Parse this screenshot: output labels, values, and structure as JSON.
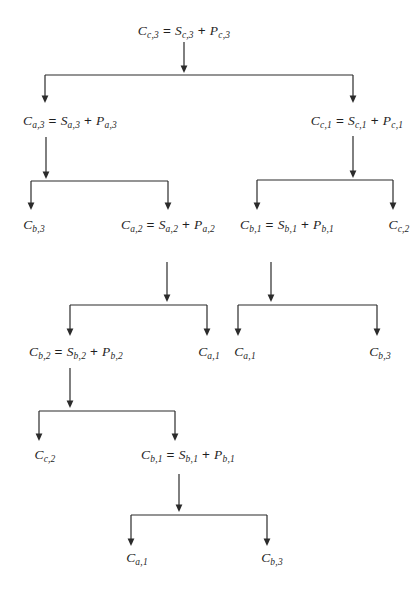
{
  "diagram": {
    "background_color": "#ffffff",
    "line_color": "#2b2b2b",
    "text_color": "#1f1f1f",
    "nodes": [
      {
        "id": "cc3",
        "label": "C_{c,3} = S_{c,3} + P_{c,3}",
        "x": 184,
        "y": 31
      },
      {
        "id": "ca3",
        "label": "C_{a,3} = S_{a,3} + P_{a,3}",
        "x": 70,
        "y": 121
      },
      {
        "id": "cc1",
        "label": "C_{c,1} = S_{c,1} + P_{c,1}",
        "x": 357,
        "y": 121
      },
      {
        "id": "cb3-a",
        "label": "C_{b,3}",
        "x": 34,
        "y": 225
      },
      {
        "id": "ca2",
        "label": "C_{a,2} = S_{a,2} + P_{a,2}",
        "x": 168,
        "y": 225
      },
      {
        "id": "cb1-a",
        "label": "C_{b,1} = S_{b,1} + P_{b,1}",
        "x": 287,
        "y": 225
      },
      {
        "id": "cc2-a",
        "label": "C_{c,2}",
        "x": 399,
        "y": 225
      },
      {
        "id": "cb2",
        "label": "C_{b,2} = S_{b,2} + P_{b,2}",
        "x": 76,
        "y": 352
      },
      {
        "id": "ca1-a",
        "label": "C_{a,1}",
        "x": 209,
        "y": 352
      },
      {
        "id": "ca1-b",
        "label": "C_{a,1}",
        "x": 245,
        "y": 352
      },
      {
        "id": "cb3-b",
        "label": "C_{b,3}",
        "x": 380,
        "y": 352
      },
      {
        "id": "cc2-b",
        "label": "C_{c,2}",
        "x": 45,
        "y": 455
      },
      {
        "id": "cb1-b",
        "label": "C_{b,1} = S_{b,1} + P_{b,1}",
        "x": 188,
        "y": 455
      },
      {
        "id": "ca1-c",
        "label": "C_{a,1}",
        "x": 137,
        "y": 558
      },
      {
        "id": "cb3-c",
        "label": "C_{b,3}",
        "x": 272,
        "y": 558
      }
    ],
    "splits": [
      {
        "parent": "cc3",
        "children": [
          "ca3",
          "cc1"
        ],
        "stem": {
          "x": 184,
          "y1": 42,
          "tip": 73
        },
        "bar": {
          "y": 75,
          "x1": 45,
          "x2": 353
        },
        "drops": [
          {
            "x": 45,
            "tip": 103
          },
          {
            "x": 353,
            "tip": 103
          }
        ]
      },
      {
        "parent": "ca3",
        "children": [
          "cb3-a",
          "ca2"
        ],
        "stem": {
          "x": 46,
          "y1": 137,
          "tip": 179
        },
        "bar": {
          "y": 181,
          "x1": 31,
          "x2": 168
        },
        "drops": [
          {
            "x": 31,
            "tip": 210
          },
          {
            "x": 168,
            "tip": 210
          }
        ]
      },
      {
        "parent": "cc1",
        "children": [
          "cb1-a",
          "cc2-a"
        ],
        "stem": {
          "x": 353,
          "y1": 136,
          "tip": 178
        },
        "bar": {
          "y": 180,
          "x1": 257,
          "x2": 393
        },
        "drops": [
          {
            "x": 257,
            "tip": 210
          },
          {
            "x": 393,
            "tip": 210
          }
        ]
      },
      {
        "parent": "ca2",
        "children": [
          "cb2",
          "ca1-a"
        ],
        "stem": {
          "x": 167,
          "y1": 262,
          "tip": 302
        },
        "bar": {
          "y": 305,
          "x1": 70,
          "x2": 207
        },
        "drops": [
          {
            "x": 70,
            "tip": 336
          },
          {
            "x": 207,
            "tip": 336
          }
        ]
      },
      {
        "parent": "cb1-a",
        "children": [
          "ca1-b",
          "cb3-b"
        ],
        "stem": {
          "x": 271,
          "y1": 262,
          "tip": 302
        },
        "bar": {
          "y": 305,
          "x1": 238,
          "x2": 377
        },
        "drops": [
          {
            "x": 238,
            "tip": 336
          },
          {
            "x": 377,
            "tip": 336
          }
        ]
      },
      {
        "parent": "cb2",
        "children": [
          "cc2-b",
          "cb1-b"
        ],
        "stem": {
          "x": 70,
          "y1": 368,
          "tip": 408
        },
        "bar": {
          "y": 411,
          "x1": 39,
          "x2": 175
        },
        "drops": [
          {
            "x": 39,
            "tip": 441
          },
          {
            "x": 175,
            "tip": 441
          }
        ]
      },
      {
        "parent": "cb1-b",
        "children": [
          "ca1-c",
          "cb3-c"
        ],
        "stem": {
          "x": 179,
          "y1": 474,
          "tip": 512
        },
        "bar": {
          "y": 515,
          "x1": 131,
          "x2": 267
        },
        "drops": [
          {
            "x": 131,
            "tip": 546
          },
          {
            "x": 267,
            "tip": 546
          }
        ]
      }
    ]
  }
}
